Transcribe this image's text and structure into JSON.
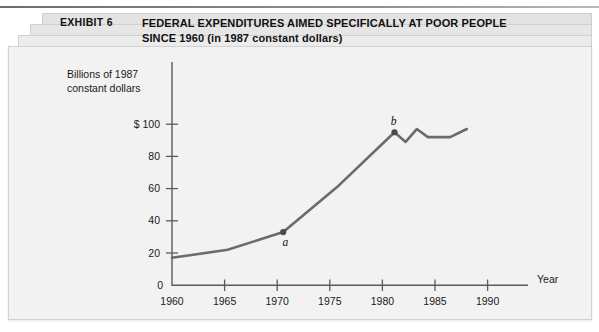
{
  "exhibit": {
    "label": "EXHIBIT 6",
    "title_line1": "FEDERAL EXPENDITURES AIMED SPECIFICALLY AT POOR PEOPLE",
    "title_line2": "SINCE 1960 (in 1987 constant dollars)"
  },
  "colors": {
    "page_background": "#ffffff",
    "card_background": "#f2f2f2",
    "stack_shadow": "#e3e3e3",
    "axis": "#5b5b5b",
    "data_line": "#6b6b6b",
    "marker": "#4a4a4a",
    "text": "#111111"
  },
  "chart_data": {
    "type": "line",
    "title": "FEDERAL EXPENDITURES AIMED SPECIFICALLY AT POOR PEOPLE SINCE 1960 (in 1987 constant dollars)",
    "xlabel": "Year",
    "ylabel": "Billions of 1987 constant dollars",
    "ylabel_line1": "Billions of 1987",
    "ylabel_line2": "constant dollars",
    "xlim": [
      1960,
      1992
    ],
    "ylim": [
      0,
      108
    ],
    "xticks": [
      1960,
      1965,
      1970,
      1975,
      1980,
      1985,
      1990
    ],
    "xtick_labels": [
      "1960",
      "1965",
      "1970",
      "1975",
      "1980",
      "1985",
      "1990"
    ],
    "yticks": [
      0,
      20,
      40,
      60,
      80,
      100
    ],
    "ytick_labels": [
      "0",
      "20",
      "40",
      "60",
      "80",
      "$ 100"
    ],
    "grid": false,
    "legend": null,
    "series": [
      {
        "name": "Federal expenditures on poor people",
        "x": [
          1960,
          1965,
          1970,
          1975,
          1980,
          1981,
          1982,
          1983,
          1985,
          1986.5
        ],
        "values": [
          17,
          22,
          33,
          62,
          95,
          89,
          97,
          92,
          92,
          97
        ]
      }
    ],
    "annotations": [
      {
        "label": "a",
        "x": 1970,
        "y": 33,
        "position": "below-right"
      },
      {
        "label": "b",
        "x": 1980,
        "y": 95,
        "position": "above-left"
      }
    ]
  }
}
